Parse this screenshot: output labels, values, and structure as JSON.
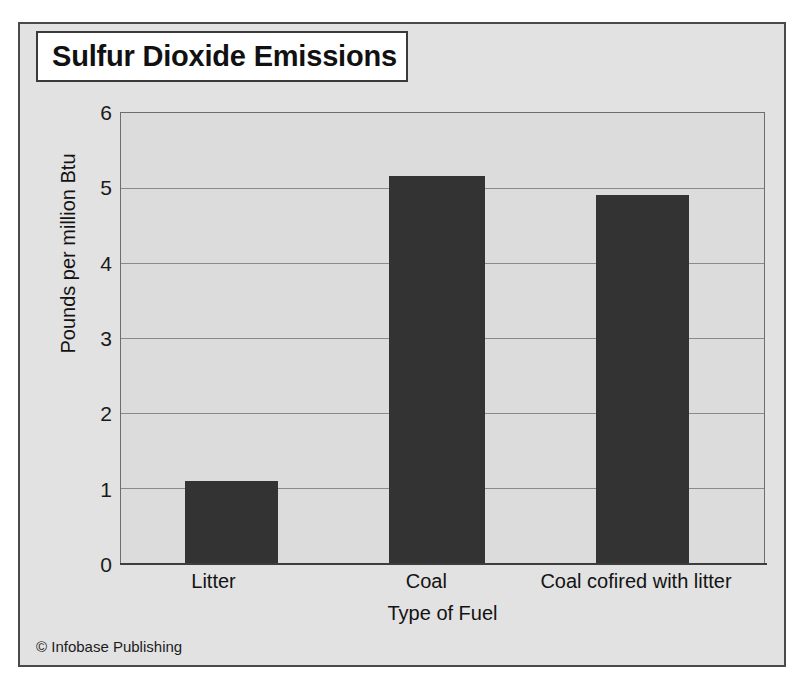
{
  "figure": {
    "title": "Sulfur Dioxide Emissions",
    "credit": "© Infobase Publishing",
    "colors": {
      "bar": "#333333",
      "plot_background": "#dcdcdc",
      "figure_background": "#e2e2e2",
      "gridline": "#8a8a8a",
      "frame_border": "#4a4a4a",
      "title_border": "#3a3a3a",
      "title_background": "#ffffff",
      "text": "#131313"
    }
  },
  "chart_data": {
    "type": "bar",
    "title": "Sulfur Dioxide Emissions",
    "xlabel": "Type of Fuel",
    "ylabel": "Pounds per million Btu",
    "categories": [
      "Litter",
      "Coal",
      "Coal cofired with litter"
    ],
    "values": [
      1.1,
      5.16,
      4.91
    ],
    "ylim": [
      0,
      6
    ],
    "ytick_labels": [
      "0",
      "1",
      "2",
      "3",
      "4",
      "5",
      "6"
    ],
    "ytick_values": [
      0,
      1,
      2,
      3,
      4,
      5,
      6
    ],
    "grid": true,
    "legend": "none",
    "bar_color": "#333333"
  }
}
